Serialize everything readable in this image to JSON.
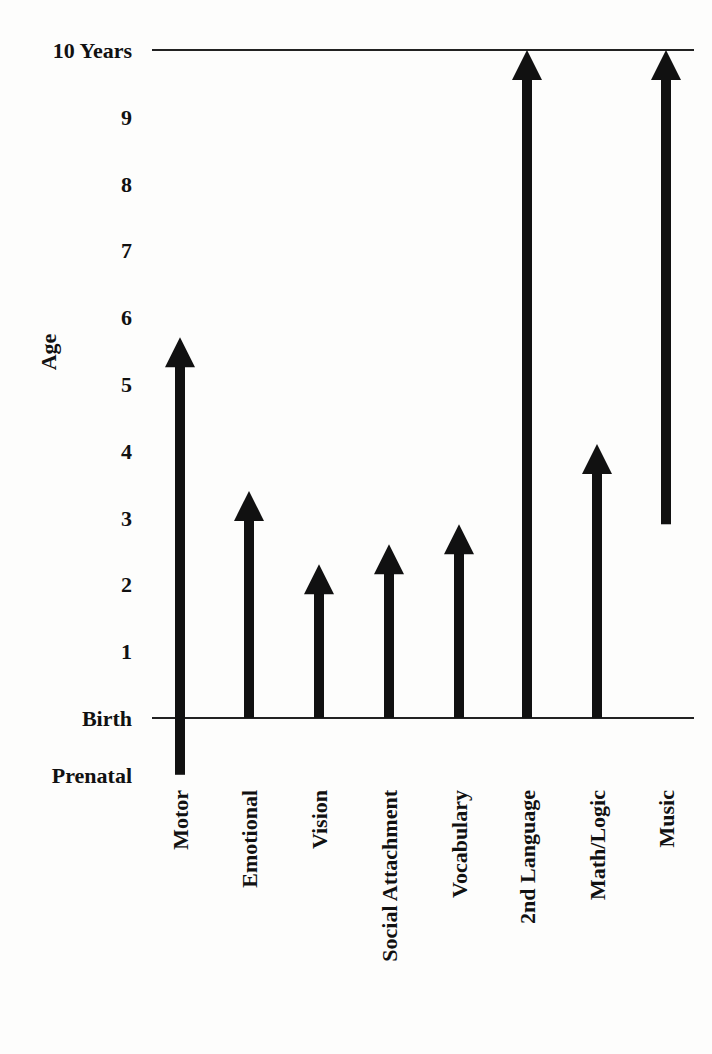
{
  "chart_data": {
    "type": "range-arrow",
    "title": "",
    "ylabel": "Age",
    "xlabel": "",
    "y_ticks": [
      {
        "label": "Prenatal",
        "value": -0.85
      },
      {
        "label": "Birth",
        "value": 0
      },
      {
        "label": "1",
        "value": 1
      },
      {
        "label": "2",
        "value": 2
      },
      {
        "label": "3",
        "value": 3
      },
      {
        "label": "4",
        "value": 4
      },
      {
        "label": "5",
        "value": 5
      },
      {
        "label": "6",
        "value": 6
      },
      {
        "label": "7",
        "value": 7
      },
      {
        "label": "8",
        "value": 8
      },
      {
        "label": "9",
        "value": 9
      },
      {
        "label": "10 Years",
        "value": 10
      }
    ],
    "reference_lines": [
      {
        "label": "Birth",
        "value": 0
      },
      {
        "label": "10 Years",
        "value": 10
      }
    ],
    "ylim": [
      -0.9,
      10
    ],
    "grid": false,
    "legend": "none",
    "categories": [
      "Motor",
      "Emotional",
      "Vision",
      "Social Attachment",
      "Vocabulary",
      "2nd Language",
      "Math/Logic",
      "Music"
    ],
    "series": [
      {
        "name": "Window of opportunity (start age)",
        "values": [
          -0.85,
          0,
          0,
          0,
          0,
          0,
          0,
          2.9
        ]
      },
      {
        "name": "Window of opportunity (end age)",
        "values": [
          5.7,
          3.4,
          2.3,
          2.6,
          2.9,
          10,
          4.1,
          10
        ]
      }
    ],
    "ranges": [
      {
        "category": "Motor",
        "start": -0.85,
        "end": 5.7
      },
      {
        "category": "Emotional",
        "start": 0,
        "end": 3.4
      },
      {
        "category": "Vision",
        "start": 0,
        "end": 2.3
      },
      {
        "category": "Social Attachment",
        "start": 0,
        "end": 2.6
      },
      {
        "category": "Vocabulary",
        "start": 0,
        "end": 2.9
      },
      {
        "category": "2nd Language",
        "start": 0,
        "end": 10
      },
      {
        "category": "Math/Logic",
        "start": 0,
        "end": 4.1
      },
      {
        "category": "Music",
        "start": 2.9,
        "end": 10
      }
    ],
    "colors": {
      "arrow": "#111111",
      "line": "#222222",
      "background": "#fdfdfc"
    }
  }
}
